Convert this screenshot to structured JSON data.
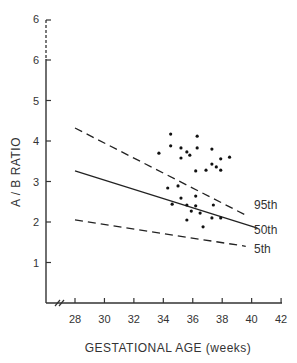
{
  "chart_data": {
    "type": "scatter",
    "title": "",
    "xlabel": "GESTATIONAL AGE (weeks)",
    "ylabel": "A / B RATIO",
    "xlim": [
      26,
      42
    ],
    "ylim": [
      0,
      7
    ],
    "grid": false,
    "x_ticks": [
      "28",
      "30",
      "32",
      "34",
      "36",
      "38",
      "40",
      "42"
    ],
    "y_ticks": [
      "1",
      "2",
      "3",
      "4",
      "5",
      "6",
      "6"
    ],
    "axis_break": {
      "x": true,
      "y_top": true
    },
    "reference_lines": [
      {
        "name": "95th",
        "style": "dashed",
        "x": [
          28,
          39.6
        ],
        "y": [
          4.32,
          2.17
        ]
      },
      {
        "name": "50th",
        "style": "solid",
        "x": [
          28,
          40.4
        ],
        "y": [
          3.26,
          1.85
        ]
      },
      {
        "name": "5th",
        "style": "dashed",
        "x": [
          28,
          39.6
        ],
        "y": [
          2.05,
          1.4
        ]
      }
    ],
    "series": [
      {
        "name": "observations",
        "points": [
          [
            34.5,
            4.17
          ],
          [
            36.3,
            4.12
          ],
          [
            34.5,
            3.88
          ],
          [
            35.2,
            3.83
          ],
          [
            36.3,
            3.83
          ],
          [
            37.3,
            3.8
          ],
          [
            35.6,
            3.73
          ],
          [
            33.7,
            3.7
          ],
          [
            35.8,
            3.65
          ],
          [
            38.5,
            3.6
          ],
          [
            35.2,
            3.58
          ],
          [
            37.9,
            3.56
          ],
          [
            37.3,
            3.43
          ],
          [
            37.6,
            3.36
          ],
          [
            36.9,
            3.28
          ],
          [
            37.9,
            3.28
          ],
          [
            36.2,
            3.26
          ],
          [
            35.0,
            2.89
          ],
          [
            34.3,
            2.84
          ],
          [
            36.2,
            2.64
          ],
          [
            35.2,
            2.59
          ],
          [
            34.6,
            2.44
          ],
          [
            35.6,
            2.42
          ],
          [
            37.4,
            2.42
          ],
          [
            36.2,
            2.4
          ],
          [
            35.9,
            2.27
          ],
          [
            36.5,
            2.22
          ],
          [
            37.3,
            2.1
          ],
          [
            37.9,
            2.1
          ],
          [
            35.6,
            2.05
          ],
          [
            36.7,
            1.88
          ]
        ]
      }
    ]
  },
  "labels": {
    "ylabel": "A / B  RATIO",
    "xlabel": "GESTATIONAL   AGE (weeks)",
    "line_95": "95th",
    "line_50": "50th",
    "line_5": "5th",
    "x_ticks": [
      "28",
      "30",
      "32",
      "34",
      "36",
      "38",
      "40",
      "42"
    ],
    "y_ticks": [
      "1",
      "2",
      "3",
      "4",
      "5",
      "6"
    ],
    "y_top_label": "6"
  }
}
